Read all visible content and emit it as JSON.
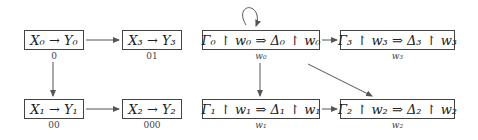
{
  "diagram": {
    "left_graph": {
      "nodes": [
        {
          "id": "n0",
          "formula": "X₀ → Y₀",
          "label": "0"
        },
        {
          "id": "n3",
          "formula": "X₃ → Y₃",
          "label": "01"
        },
        {
          "id": "n1",
          "formula": "X₁ → Y₁",
          "label": "00"
        },
        {
          "id": "n2",
          "formula": "X₂ → Y₂",
          "label": "000"
        }
      ],
      "edges": [
        {
          "from": "n0",
          "to": "n3"
        },
        {
          "from": "n0",
          "to": "n1"
        },
        {
          "from": "n1",
          "to": "n2"
        }
      ]
    },
    "right_graph": {
      "nodes": [
        {
          "id": "m0",
          "formula": "Γ₀ ↾ w₀ ⇒ Δ₀ ↾ w₀",
          "label": "w₀"
        },
        {
          "id": "m3",
          "formula": "Γ₃ ↾ w₃ ⇒ Δ₃ ↾ w₃",
          "label": "w₃"
        },
        {
          "id": "m1",
          "formula": "Γ₁ ↾ w₁ ⇒ Δ₁ ↾ w₁",
          "label": "w₁"
        },
        {
          "id": "m2",
          "formula": "Γ₂ ↾ w₂ ⇒ Δ₂ ↾ w₂",
          "label": "w₂"
        }
      ],
      "edges": [
        {
          "from": "m0",
          "to": "m0",
          "type": "loop"
        },
        {
          "from": "m0",
          "to": "m3"
        },
        {
          "from": "m0",
          "to": "m1"
        },
        {
          "from": "m0",
          "to": "m2"
        },
        {
          "from": "m1",
          "to": "m2"
        }
      ]
    }
  }
}
